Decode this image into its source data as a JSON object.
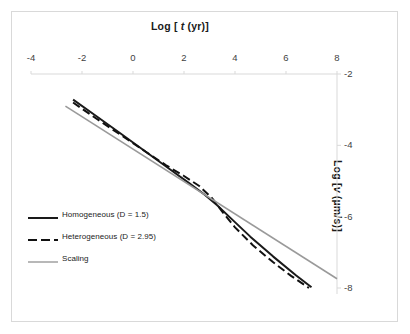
{
  "chart_data": {
    "type": "line",
    "title": "",
    "xlabel": "Log [ t (yr)]",
    "xlabel_prefix": "Log [ ",
    "xlabel_italic": "t",
    "xlabel_suffix": " (yr)]",
    "ylabel": "Log [v (µm/s)]",
    "ylabel_prefix": "Log [",
    "ylabel_italic": "v",
    "ylabel_suffix": " (µm/s)]",
    "xlim": [
      -4,
      8
    ],
    "ylim": [
      -8,
      -2
    ],
    "xticks": [
      -4,
      -2,
      0,
      2,
      4,
      6,
      8
    ],
    "xtick_labels": [
      "-4",
      "-2",
      "0",
      "2",
      "4",
      "6",
      "8"
    ],
    "yticks": [
      -2,
      -4,
      -6,
      -8
    ],
    "ytick_labels": [
      "-2",
      "-4",
      "-6",
      "-8"
    ],
    "grid": false,
    "legend_position": "inside-lower-left",
    "axis_color": "#d9d9d9",
    "series": [
      {
        "name": "Homogeneous (D = 1.5)",
        "style": "solid",
        "color": "#1a1a1a",
        "width": 2.0,
        "points": [
          [
            -2.35,
            -2.72
          ],
          [
            -1.5,
            -3.15
          ],
          [
            -0.5,
            -3.66
          ],
          [
            0.5,
            -4.18
          ],
          [
            1.5,
            -4.7
          ],
          [
            2.2,
            -5.06
          ],
          [
            2.8,
            -5.38
          ],
          [
            3.3,
            -5.68
          ],
          [
            3.8,
            -6.02
          ],
          [
            4.6,
            -6.56
          ],
          [
            5.5,
            -7.12
          ],
          [
            6.4,
            -7.65
          ],
          [
            7.0,
            -7.98
          ]
        ]
      },
      {
        "name": "Heterogeneous (D = 2.95)",
        "style": "dashed",
        "color": "#111111",
        "width": 2.0,
        "points": [
          [
            -2.35,
            -2.8
          ],
          [
            -1.5,
            -3.22
          ],
          [
            -0.5,
            -3.7
          ],
          [
            0.5,
            -4.18
          ],
          [
            1.3,
            -4.56
          ],
          [
            2.0,
            -4.86
          ],
          [
            2.6,
            -5.14
          ],
          [
            3.1,
            -5.48
          ],
          [
            3.5,
            -5.86
          ],
          [
            4.0,
            -6.3
          ],
          [
            4.7,
            -6.8
          ],
          [
            5.5,
            -7.28
          ],
          [
            6.2,
            -7.66
          ],
          [
            6.9,
            -8.0
          ]
        ]
      },
      {
        "name": "Scaling",
        "style": "solid",
        "color": "#9a9a9a",
        "width": 1.6,
        "points": [
          [
            -2.65,
            -2.9
          ],
          [
            8.0,
            -7.74
          ]
        ]
      }
    ]
  },
  "legend": {
    "items": [
      {
        "label": "Homogeneous (D = 1.5)",
        "style": "solid",
        "color": "#1a1a1a"
      },
      {
        "label": "Heterogeneous (D = 2.95)",
        "style": "dashed",
        "color": "#111111"
      },
      {
        "label": "Scaling",
        "style": "solid",
        "color": "#9a9a9a"
      }
    ]
  }
}
